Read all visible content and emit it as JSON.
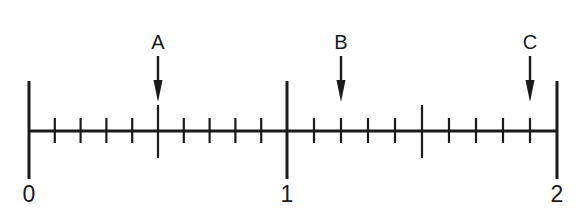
{
  "figure": {
    "type": "number-line",
    "stroke_color": "#1a1a1a",
    "background": "#ffffff",
    "range": [
      0,
      2
    ],
    "major_labels": [
      {
        "value": 0,
        "text": "0"
      },
      {
        "value": 1,
        "text": "1"
      },
      {
        "value": 2,
        "text": "2"
      }
    ],
    "subdivisions_per_unit": 10,
    "half_unit_long_ticks": [
      0.5,
      1.5
    ],
    "points": [
      {
        "label": "A",
        "value": 0.5
      },
      {
        "label": "B",
        "value": 1.2
      },
      {
        "label": "C",
        "value": 1.9
      }
    ]
  }
}
